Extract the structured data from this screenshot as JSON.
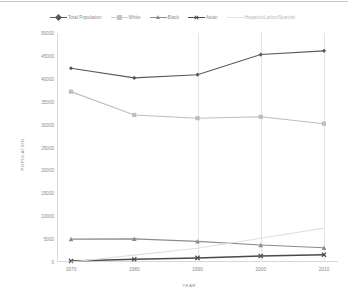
{
  "chart_data": {
    "type": "line",
    "title": "",
    "xlabel": "YEAR",
    "ylabel": "POPULATION",
    "categories": [
      "1970",
      "1980",
      "1990",
      "2000",
      "2010"
    ],
    "x": [
      1970,
      1980,
      1990,
      2000,
      2010
    ],
    "ylim": [
      0,
      50000
    ],
    "y_ticks": [
      0,
      5000,
      10000,
      15000,
      20000,
      25000,
      30000,
      35000,
      40000,
      45000,
      50000
    ],
    "y_tick_labels": [
      "0",
      "5000",
      "10000",
      "15000",
      "20000",
      "25000",
      "30000",
      "35000",
      "40000",
      "45000",
      "50000"
    ],
    "grid": "vertical-only",
    "legend_position": "top",
    "series": [
      {
        "name": "Total Population",
        "marker": "diamond",
        "color": "#595959",
        "values": [
          42300,
          40200,
          40900,
          45300,
          46100
        ]
      },
      {
        "name": "White",
        "marker": "square",
        "color": "#bdbdbd",
        "values": [
          37200,
          32100,
          31400,
          31700,
          30200
        ]
      },
      {
        "name": "Black",
        "marker": "triangle",
        "color": "#8c8c8c",
        "values": [
          5000,
          5050,
          4500,
          3700,
          3100
        ]
      },
      {
        "name": "Asian",
        "marker": "x",
        "color": "#4a4a4a",
        "values": [
          200,
          600,
          900,
          1300,
          1600
        ]
      },
      {
        "name": "Hispanic/Latino/Spanish",
        "marker": "none",
        "color": "#e0e0e0",
        "values": [
          0,
          1500,
          3000,
          5200,
          7400
        ]
      }
    ]
  },
  "legend": {
    "items": [
      {
        "label": "Total Population"
      },
      {
        "label": "White"
      },
      {
        "label": "Black"
      },
      {
        "label": "Asian"
      },
      {
        "label": "Hispanic/Latino/Spanish"
      }
    ]
  }
}
